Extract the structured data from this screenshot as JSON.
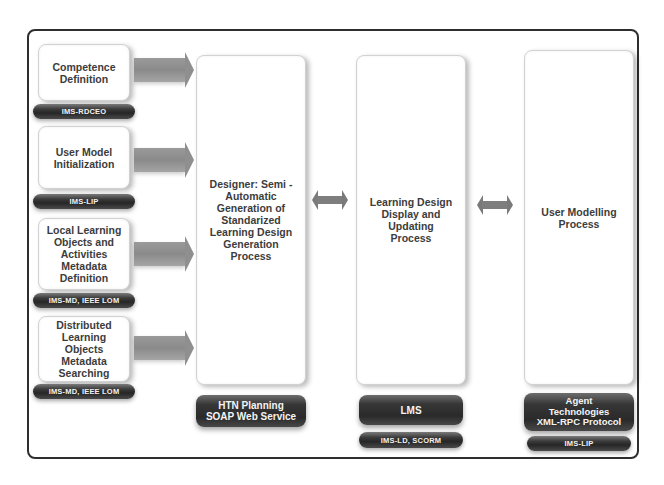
{
  "diagram": {
    "inputs": [
      {
        "label": "Competence\nDefinition",
        "standard": "IMS-RDCEO"
      },
      {
        "label": "User Model\nInitialization",
        "standard": "IMS-LIP"
      },
      {
        "label": "Local Learning\nObjects and\nActivities\nMetadata\nDefinition",
        "standard": "IMS-MD, IEEE LOM"
      },
      {
        "label": "Distributed\nLearning\nObjects\nMetadata\nSearching",
        "standard": "IMS-MD, IEEE LOM"
      }
    ],
    "columns": [
      {
        "label": "Designer: Semi -\nAutomatic\nGeneration of\nStandarized\nLearning Design\nGeneration\nProcess",
        "technology": "HTN Planning\nSOAP Web Service",
        "standard": null
      },
      {
        "label": "Learning Design\nDisplay and\nUpdating\nProcess",
        "technology": "LMS",
        "standard": "IMS-LD, SCORM"
      },
      {
        "label": "User Modelling\nProcess",
        "technology": "Agent\nTechnologies\nXML-RPC Protocol",
        "standard": "IMS-LIP"
      }
    ],
    "connectors": [
      {
        "from": "inputs",
        "to": "columns.0",
        "type": "single-arrow"
      },
      {
        "from": "columns.0",
        "to": "columns.1",
        "type": "double-arrow"
      },
      {
        "from": "columns.1",
        "to": "columns.2",
        "type": "double-arrow"
      }
    ],
    "colors": {
      "frame": "#2e2e2e",
      "box_border": "#d2d2d2",
      "pill_dark": "#2a2a2a",
      "arrow": "#8f8f8f",
      "text": "#3c3c3c"
    }
  }
}
